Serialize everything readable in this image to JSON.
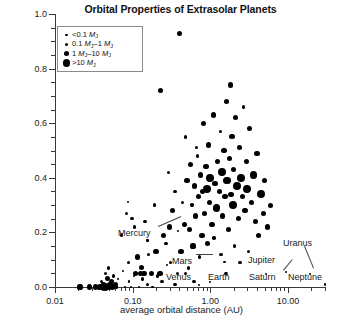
{
  "title": "Orbital Properties of Extrasolar Planets",
  "axes": {
    "x_title": "average orbital distance (AU)",
    "y_title": "orbital eccentricity",
    "x_ticks": [
      "0.01",
      "0.10",
      "1.00",
      "10.00"
    ],
    "y_ticks": [
      "0.0",
      "0.2",
      "0.4",
      "0.6",
      "0.8",
      "1.0"
    ]
  },
  "legend": {
    "items": [
      {
        "label": "<0.1 MJ",
        "html": "&lt;0.1 <i>M</i><sub>J</sub>",
        "radius_px": 1.1
      },
      {
        "label": "0.1 MJ-1 MJ",
        "html": "0.1 <i>M</i><sub>J</sub>–1 <i>M</i><sub>J</sub>",
        "radius_px": 1.7
      },
      {
        "label": "1 MJ-10 MJ",
        "html": "1 <i>M</i><sub>J</sub>–10 <i>M</i><sub>J</sub>",
        "radius_px": 2.6
      },
      {
        "label": ">10 MJ",
        "html": "&gt;10 <i>M</i><sub>J</sub>",
        "radius_px": 3.9
      }
    ]
  },
  "annotations": [
    {
      "name": "Mercury",
      "x_px": 118,
      "y_px": 228,
      "leader": {
        "x1": 158,
        "y1": 226,
        "x2": 181,
        "y2": 216
      }
    },
    {
      "name": "Mars",
      "x_px": 172,
      "y_px": 256,
      "leader": {
        "x1": 196,
        "y1": 254,
        "x2": 213,
        "y2": 254
      }
    },
    {
      "name": "Venus",
      "x_px": 166,
      "y_px": 272,
      "leader": null
    },
    {
      "name": "Earth",
      "x_px": 208,
      "y_px": 272,
      "leader": null
    },
    {
      "name": "Saturn",
      "x_px": 249,
      "y_px": 272,
      "leader": {
        "x1": 283,
        "y1": 270,
        "x2": 292,
        "y2": 259
      }
    },
    {
      "name": "Jupiter",
      "x_px": 248,
      "y_px": 255,
      "leader": null
    },
    {
      "name": "Uranus",
      "x_px": 283,
      "y_px": 238,
      "leader": {
        "x1": 305,
        "y1": 246,
        "x2": 314,
        "y2": 268
      }
    },
    {
      "name": "Neptune",
      "x_px": 288,
      "y_px": 272,
      "leader": null
    }
  ],
  "chart_data": {
    "type": "scatter",
    "title": "Orbital Properties of Extrasolar Planets",
    "xlabel": "average orbital distance (AU)",
    "ylabel": "orbital eccentricity",
    "xscale": "log",
    "yscale": "linear",
    "xlim": [
      0.01,
      30.0
    ],
    "ylim": [
      0.0,
      1.0
    ],
    "grid": false,
    "legend_position": "upper-left-inside",
    "size_legend": {
      "variable": "planet mass",
      "units": "Jupiter masses (MJ)",
      "bins": [
        "<0.1 MJ",
        "0.1 MJ-1 MJ",
        "1 MJ-10 MJ",
        ">10 MJ"
      ]
    },
    "series": [
      {
        "name": "extrasolar planets",
        "points": [
          [
            0.021,
            0.0,
            3
          ],
          [
            0.028,
            0.0,
            3
          ],
          [
            0.038,
            0.0,
            3
          ],
          [
            0.04,
            0.02,
            2
          ],
          [
            0.042,
            0.01,
            3
          ],
          [
            0.044,
            0.0,
            4
          ],
          [
            0.045,
            0.05,
            2
          ],
          [
            0.046,
            0.0,
            3
          ],
          [
            0.047,
            0.03,
            3
          ],
          [
            0.048,
            0.0,
            3
          ],
          [
            0.049,
            0.07,
            2
          ],
          [
            0.05,
            0.0,
            3
          ],
          [
            0.051,
            0.01,
            3
          ],
          [
            0.052,
            0.0,
            2
          ],
          [
            0.053,
            0.02,
            3
          ],
          [
            0.055,
            0.0,
            3
          ],
          [
            0.057,
            0.04,
            2
          ],
          [
            0.058,
            0.0,
            2
          ],
          [
            0.06,
            0.01,
            3
          ],
          [
            0.062,
            0.0,
            2
          ],
          [
            0.065,
            0.03,
            1
          ],
          [
            0.072,
            0.19,
            2
          ],
          [
            0.075,
            0.06,
            1
          ],
          [
            0.08,
            0.0,
            1
          ],
          [
            0.083,
            0.27,
            2
          ],
          [
            0.088,
            0.09,
            2
          ],
          [
            0.09,
            0.02,
            1
          ],
          [
            0.095,
            0.0,
            1
          ],
          [
            0.098,
            0.25,
            2
          ],
          [
            0.105,
            0.04,
            1
          ],
          [
            0.11,
            0.05,
            3
          ],
          [
            0.115,
            0.11,
            3
          ],
          [
            0.12,
            0.0,
            1
          ],
          [
            0.125,
            0.05,
            3
          ],
          [
            0.13,
            0.07,
            3
          ],
          [
            0.14,
            0.05,
            3
          ],
          [
            0.145,
            0.24,
            2
          ],
          [
            0.155,
            0.01,
            2
          ],
          [
            0.16,
            0.12,
            2
          ],
          [
            0.175,
            0.05,
            3
          ],
          [
            0.18,
            0.0,
            1
          ],
          [
            0.19,
            0.3,
            2
          ],
          [
            0.2,
            0.13,
            3
          ],
          [
            0.21,
            0.04,
            2
          ],
          [
            0.225,
            0.05,
            3
          ],
          [
            0.23,
            0.72,
            3
          ],
          [
            0.25,
            0.19,
            3
          ],
          [
            0.27,
            0.16,
            2
          ],
          [
            0.29,
            0.42,
            2
          ],
          [
            0.3,
            0.22,
            3
          ],
          [
            0.31,
            0.09,
            2
          ],
          [
            0.33,
            0.28,
            3
          ],
          [
            0.35,
            0.35,
            2
          ],
          [
            0.38,
            0.05,
            2
          ],
          [
            0.4,
            0.93,
            3
          ],
          [
            0.42,
            0.13,
            3
          ],
          [
            0.44,
            0.31,
            2
          ],
          [
            0.46,
            0.23,
            3
          ],
          [
            0.48,
            0.55,
            2
          ],
          [
            0.5,
            0.39,
            3
          ],
          [
            0.52,
            0.07,
            2
          ],
          [
            0.54,
            0.21,
            3
          ],
          [
            0.56,
            0.45,
            3
          ],
          [
            0.58,
            0.3,
            2
          ],
          [
            0.6,
            0.15,
            3
          ],
          [
            0.62,
            0.37,
            3
          ],
          [
            0.65,
            0.26,
            3
          ],
          [
            0.68,
            0.48,
            2
          ],
          [
            0.7,
            0.33,
            3
          ],
          [
            0.72,
            0.11,
            2
          ],
          [
            0.75,
            0.41,
            3
          ],
          [
            0.78,
            0.19,
            3
          ],
          [
            0.8,
            0.35,
            3
          ],
          [
            0.82,
            0.6,
            3
          ],
          [
            0.85,
            0.27,
            3
          ],
          [
            0.88,
            0.44,
            3
          ],
          [
            0.9,
            0.36,
            4
          ],
          [
            0.92,
            0.16,
            3
          ],
          [
            0.95,
            0.52,
            3
          ],
          [
            0.98,
            0.31,
            3
          ],
          [
            1.0,
            0.4,
            4
          ],
          [
            1.05,
            0.23,
            3
          ],
          [
            1.1,
            0.63,
            3
          ],
          [
            1.15,
            0.38,
            3
          ],
          [
            1.2,
            0.29,
            4
          ],
          [
            1.25,
            0.46,
            3
          ],
          [
            1.3,
            0.35,
            3
          ],
          [
            1.35,
            0.57,
            2
          ],
          [
            1.4,
            0.42,
            4
          ],
          [
            1.45,
            0.26,
            3
          ],
          [
            1.5,
            0.5,
            3
          ],
          [
            1.55,
            0.33,
            3
          ],
          [
            1.6,
            0.68,
            3
          ],
          [
            1.65,
            0.39,
            4
          ],
          [
            1.7,
            0.21,
            3
          ],
          [
            1.75,
            0.47,
            3
          ],
          [
            1.8,
            0.74,
            3
          ],
          [
            1.85,
            0.34,
            3
          ],
          [
            1.9,
            0.55,
            3
          ],
          [
            1.95,
            0.3,
            4
          ],
          [
            2.0,
            0.43,
            3
          ],
          [
            2.1,
            0.62,
            3
          ],
          [
            2.2,
            0.37,
            4
          ],
          [
            2.3,
            0.25,
            3
          ],
          [
            2.4,
            0.51,
            3
          ],
          [
            2.5,
            0.4,
            4
          ],
          [
            2.6,
            0.33,
            3
          ],
          [
            2.7,
            0.66,
            2
          ],
          [
            2.8,
            0.28,
            3
          ],
          [
            2.9,
            0.46,
            3
          ],
          [
            3.0,
            0.36,
            4
          ],
          [
            3.2,
            0.58,
            3
          ],
          [
            3.4,
            0.31,
            3
          ],
          [
            3.6,
            0.41,
            4
          ],
          [
            3.8,
            0.24,
            3
          ],
          [
            4.0,
            0.49,
            3
          ],
          [
            4.2,
            0.19,
            3
          ],
          [
            4.5,
            0.34,
            4
          ],
          [
            4.8,
            0.27,
            3
          ],
          [
            5.0,
            0.39,
            3
          ],
          [
            5.5,
            0.22,
            3
          ],
          [
            6.0,
            0.3,
            3
          ],
          [
            0.033,
            0.0,
            3
          ],
          [
            0.036,
            0.0,
            2
          ],
          [
            0.105,
            0.22,
            2
          ],
          [
            0.135,
            0.03,
            2
          ],
          [
            0.66,
            0.51,
            2
          ],
          [
            1.12,
            0.18,
            2
          ],
          [
            1.38,
            0.12,
            2
          ],
          [
            2.05,
            0.15,
            2
          ],
          [
            0.24,
            0.02,
            2
          ],
          [
            0.35,
            0.01,
            2
          ],
          [
            0.48,
            0.05,
            2
          ],
          [
            0.62,
            0.02,
            2
          ],
          [
            0.155,
            0.17,
            1
          ],
          [
            0.088,
            0.31,
            1
          ],
          [
            0.28,
            0.08,
            1
          ],
          [
            1.6,
            0.05,
            2
          ],
          [
            2.4,
            0.09,
            2
          ],
          [
            3.1,
            0.13,
            2
          ]
        ]
      },
      {
        "name": "solar system planets",
        "points": [
          [
            0.387,
            0.206,
            1
          ],
          [
            0.723,
            0.007,
            1
          ],
          [
            1.0,
            0.017,
            1
          ],
          [
            1.524,
            0.093,
            1
          ],
          [
            5.203,
            0.048,
            1
          ],
          [
            9.537,
            0.054,
            1
          ],
          [
            19.19,
            0.047,
            1
          ],
          [
            30.07,
            0.009,
            1
          ]
        ]
      }
    ]
  }
}
